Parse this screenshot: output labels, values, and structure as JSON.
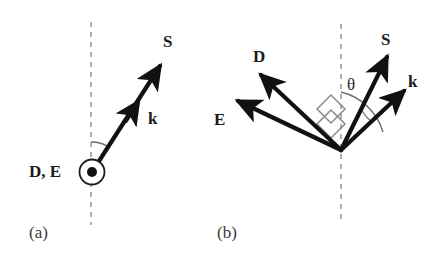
{
  "figure": {
    "type": "vector-diagram",
    "background_color": "#ffffff",
    "vector_color": "#111111",
    "dashed_axis_color": "#9a9a9a",
    "angle_mark_color": "#777777",
    "panels": [
      {
        "id": "a",
        "caption": "(a)",
        "origin": {
          "x": 92,
          "y": 172
        },
        "axis": {
          "name": "vertical-dashed-axis",
          "x": 91,
          "y_top": 22,
          "y_bottom": 225,
          "dash": "5 5"
        },
        "out_of_page_symbol": {
          "name": "circle-dot-symbol",
          "cx": 92,
          "cy": 172,
          "radius": 12,
          "dot_radius": 5,
          "label": "D, E",
          "meaning": "D and E point out of the page"
        },
        "vectors": [
          {
            "label": "S",
            "name": "vector-S",
            "from": {
              "x": 92,
              "y": 172
            },
            "to": {
              "x": 163,
              "y": 62
            },
            "mid_arrow_label": "k",
            "mid_arrow_at": 0.58,
            "note": "S and k are collinear in this panel"
          }
        ],
        "angle_arc": {
          "name": "angle-arc-a",
          "radius": 30,
          "from_deg": 0,
          "to_deg": 33,
          "labeled": false
        },
        "labels": [
          {
            "text": "S",
            "name": "label-S"
          },
          {
            "text": "k",
            "name": "label-k"
          },
          {
            "text": "D, E",
            "name": "label-D-E"
          }
        ]
      },
      {
        "id": "b",
        "caption": "(b)",
        "origin": {
          "x": 341,
          "y": 150
        },
        "axis": {
          "name": "vertical-dashed-axis",
          "x": 341,
          "y_top": 24,
          "y_bottom": 222,
          "dash": "5 5"
        },
        "vectors": [
          {
            "label": "D",
            "name": "vector-D",
            "from": {
              "x": 341,
              "y": 150
            },
            "to": {
              "x": 258,
              "y": 72
            },
            "angle_deg": 227
          },
          {
            "label": "E",
            "name": "vector-E",
            "from": {
              "x": 341,
              "y": 150
            },
            "to": {
              "x": 234,
              "y": 99
            },
            "angle_deg": 205
          },
          {
            "label": "S",
            "name": "vector-S",
            "from": {
              "x": 341,
              "y": 150
            },
            "to": {
              "x": 389,
              "y": 53
            },
            "angle_deg": 26
          },
          {
            "label": "k",
            "name": "vector-k",
            "from": {
              "x": 341,
              "y": 150
            },
            "to": {
              "x": 408,
              "y": 88
            },
            "angle_deg": 47
          }
        ],
        "angle_arc": {
          "name": "theta-arc",
          "label": "θ",
          "radius": 58,
          "between": [
            "vertical-dashed-axis",
            "vector-k"
          ],
          "value_deg": 47
        },
        "secondary_arc": {
          "name": "theta-arc-inner",
          "radius": 44,
          "between": [
            "vector-S",
            "vector-k"
          ]
        },
        "right_angle_marks": [
          {
            "name": "right-angle-D-S",
            "between": [
              "vector-D",
              "vector-S"
            ],
            "size": 20
          },
          {
            "name": "right-angle-E-k",
            "between": [
              "vector-E",
              "vector-k"
            ],
            "size": 20
          }
        ],
        "labels": [
          {
            "text": "D",
            "name": "label-D"
          },
          {
            "text": "E",
            "name": "label-E"
          },
          {
            "text": "S",
            "name": "label-S"
          },
          {
            "text": "k",
            "name": "label-k"
          },
          {
            "text": "θ",
            "name": "label-theta"
          }
        ]
      }
    ]
  },
  "panel_a": {
    "caption": "(a)",
    "label_S": "S",
    "label_k": "k",
    "label_DE": "D, E"
  },
  "panel_b": {
    "caption": "(b)",
    "label_D": "D",
    "label_E": "E",
    "label_S": "S",
    "label_k": "k",
    "label_theta": "θ"
  }
}
